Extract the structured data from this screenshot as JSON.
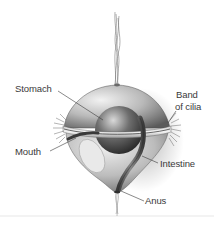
{
  "diagram": {
    "labels": {
      "stomach": "Stomach",
      "band_of_cilia_line1": "Band",
      "band_of_cilia_line2": "of cilia",
      "mouth": "Mouth",
      "intestine": "Intestine",
      "anus": "Anus"
    },
    "colors": {
      "background": "#ffffff",
      "label_text": "#3a3a3a",
      "leader_line": "#3a3a3a",
      "body_light": "#e6e6e6",
      "body_mid": "#a8a8a8",
      "body_dark": "#4a4a4a",
      "stomach_dark": "#2f2f2f"
    }
  }
}
